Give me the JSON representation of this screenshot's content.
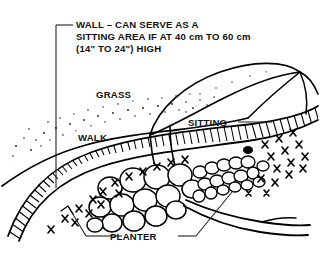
{
  "figure": {
    "kind": "landscape-cross-section-line-drawing",
    "background_color": "#ffffff",
    "ink_color": "#000000"
  },
  "callouts": {
    "wall": {
      "id": "wall-callout",
      "line1": "WALL – CAN SERVE AS A",
      "line2": "SITTING AREA IF AT 40 cm TO 60 cm",
      "line3": "(14\" TO 24\") HIGH"
    },
    "grass": {
      "id": "grass-label",
      "text": "GRASS"
    },
    "walk": {
      "id": "walk-label",
      "text": "WALK"
    },
    "sitting": {
      "id": "sitting-label",
      "text": "SITTING"
    },
    "planter": {
      "id": "planter-label",
      "text": "PLANTER"
    }
  },
  "elements": {
    "grass_mound": "stippled-earth-mound",
    "retaining_wall": "hatched-band",
    "planter_fill": "rounded-stones",
    "vegetation": "x-shaped-grass-tufts",
    "roots": "branching-root-lines"
  }
}
